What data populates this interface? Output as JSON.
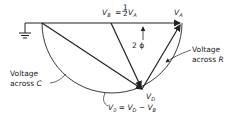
{
  "diagram": {
    "labels": {
      "vb": "V",
      "vb_sub": "B",
      "vb_eq": "= ",
      "half_num": "1",
      "half_den": "2",
      "va_after_half": "V",
      "va_after_half_sub": "A",
      "va": "V",
      "va_sub": "A",
      "phi": "2 ϕ",
      "voltage_r_line1": "Voltage",
      "voltage_r_line2": "across",
      "voltage_r_var": "R",
      "voltage_c_line1": "Voltage",
      "voltage_c_line2": "across",
      "voltage_c_var": "C",
      "vd": "V",
      "vd_sub": "D",
      "vo_eq": "V",
      "vo_eq_sub": "0",
      "vo_eq_rest1": " = V",
      "vo_eq_rest1_sub": "D",
      "vo_eq_rest2": " − V",
      "vo_eq_rest2_sub": "B"
    },
    "colors": {
      "ink": "#222222",
      "background": "#ffffff"
    }
  }
}
